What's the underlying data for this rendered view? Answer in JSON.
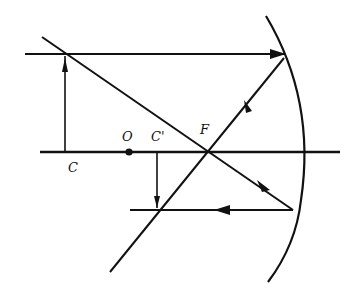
{
  "diagram": {
    "type": "concave-mirror-ray-diagram",
    "labels": {
      "C": "C",
      "O": "O",
      "C_prime": "C'",
      "F": "F"
    },
    "colors": {
      "ink": "#111111",
      "background": "#ffffff"
    },
    "elements": [
      "principal-axis",
      "concave-mirror",
      "object-arrow at C",
      "image-arrow at C'",
      "parallel incident ray reflected through F",
      "ray through F reflected parallel",
      "pole dot O"
    ]
  }
}
